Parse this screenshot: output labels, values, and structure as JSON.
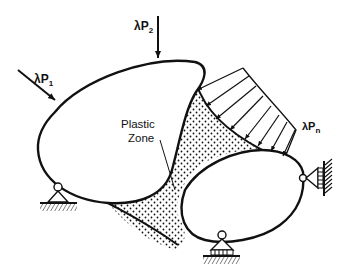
{
  "diagram": {
    "type": "structural mechanics schematic",
    "loads": [
      {
        "id": "P1",
        "prefix": "λP",
        "sub": "1",
        "kind": "point load (inclined)"
      },
      {
        "id": "P2",
        "prefix": "λP",
        "sub": "2",
        "kind": "point load (vertical)"
      },
      {
        "id": "Pn",
        "prefix": "λP",
        "sub": "n",
        "kind": "distributed load"
      }
    ],
    "zone_label": {
      "line1": "Plastic",
      "line2": "Zone"
    },
    "bodies": [
      "large-body",
      "small-body"
    ],
    "supports": [
      {
        "id": "support-left",
        "kind": "pin support"
      },
      {
        "id": "support-bottom",
        "kind": "roller support"
      },
      {
        "id": "support-right",
        "kind": "roller support (wall)"
      }
    ],
    "colors": {
      "stroke": "#111111",
      "background": "#ffffff"
    }
  }
}
